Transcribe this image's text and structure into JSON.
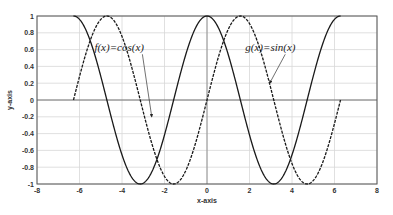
{
  "chart_data": {
    "type": "line",
    "title": "",
    "xlabel": "x-axis",
    "ylabel": "y-axis",
    "xlim": [
      -8,
      8
    ],
    "ylim": [
      -1,
      1
    ],
    "grid": true,
    "legend": "none",
    "x_ticks": [
      "-8",
      "-6",
      "-4",
      "-2",
      "0",
      "2",
      "4",
      "6",
      "8"
    ],
    "y_ticks": [
      "1",
      "0.8",
      "0.6",
      "0.4",
      "0.2",
      "0",
      "-0.2",
      "-0.4",
      "-0.6",
      "-0.8",
      "-1"
    ],
    "x_domain": [
      -6.2832,
      6.2832
    ],
    "series": [
      {
        "name": "f(x)=cos(x)",
        "function": "cos",
        "style": "solid",
        "color": "#1a1a1a"
      },
      {
        "name": "g(x)=sin(x)",
        "function": "sin",
        "style": "dashed",
        "color": "#1a1a1a"
      }
    ],
    "annotations": [
      {
        "text": "f(x)=cos(x)",
        "text_pos": [
          -5.3,
          0.58
        ],
        "arrow_to": [
          -2.6,
          -0.2
        ]
      },
      {
        "text": "g(x)=sin(x)",
        "text_pos": [
          1.8,
          0.58
        ],
        "arrow_to": [
          2.95,
          0.2
        ]
      }
    ]
  },
  "colors": {
    "grid": "#d8d8d8",
    "axis": "#555555",
    "curve": "#1a1a1a"
  }
}
